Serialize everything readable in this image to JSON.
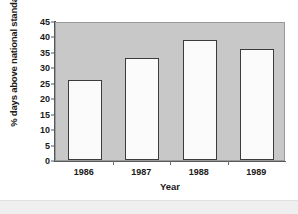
{
  "chart_data": {
    "type": "bar",
    "title": "",
    "categories": [
      "1986",
      "1987",
      "1988",
      "1989"
    ],
    "values": [
      26,
      33,
      39,
      36
    ],
    "xlabel": "Year",
    "ylabel": "% days above national standard",
    "ylim": [
      0,
      45
    ],
    "ytick_step": 5,
    "yticks": [
      "45",
      "40",
      "35",
      "30",
      "25",
      "20",
      "15",
      "10",
      "5",
      "0"
    ],
    "grid": false,
    "legend": false,
    "bar_fill_color": "#ffffff",
    "bar_edge_color": "#3a3d3f",
    "plot_background_color": "#c8c8c8",
    "figure_background_color": "#ffffff"
  },
  "panels": {
    "lower_strip_color": "#efefef"
  }
}
